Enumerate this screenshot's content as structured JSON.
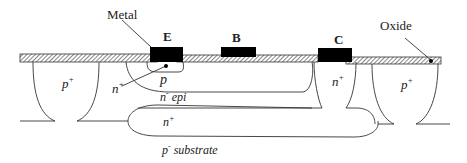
{
  "labels": {
    "metal": "Metal",
    "oxide": "Oxide",
    "emitter": "E",
    "base": "B",
    "collector": "C",
    "p_plus_left": "p",
    "p_plus_left_sup": "+",
    "p_plus_right": "p",
    "p_plus_right_sup": "+",
    "n_plus_collector": "n",
    "n_plus_collector_sup": "+",
    "n_plus_emitter": "n",
    "n_plus_emitter_sup": "+",
    "p_base": "p",
    "n_epi": "n",
    "n_epi_sup": "-",
    "n_epi_suffix": " epi",
    "n_plus_buried": "n",
    "n_plus_buried_sup": "+",
    "p_substrate": "p",
    "p_substrate_sup": "-",
    "p_substrate_suffix": " substrate"
  },
  "colors": {
    "line": "#333333",
    "metal": "#000000",
    "hatch": "#555555"
  }
}
